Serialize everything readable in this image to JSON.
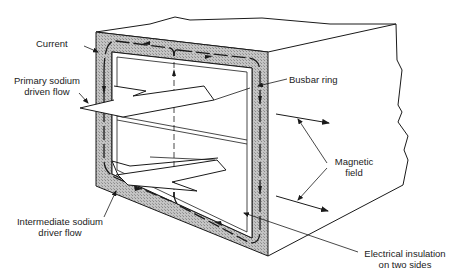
{
  "diagram": {
    "colors": {
      "line": "#1a1a1a",
      "busbar_fill": "#bdbdbd",
      "background": "#ffffff"
    },
    "labels": {
      "current": "Current",
      "primary_flow_line1": "Primary sodium",
      "primary_flow_line2": "driven flow",
      "busbar_ring": "Busbar ring",
      "magnetic_field_line1": "Magnetic",
      "magnetic_field_line2": "field",
      "intermediate_flow_line1": "Intermediate sodium",
      "intermediate_flow_line2": "driver flow",
      "insulation_line1": "Electrical insulation",
      "insulation_line2": "on two sides"
    }
  }
}
